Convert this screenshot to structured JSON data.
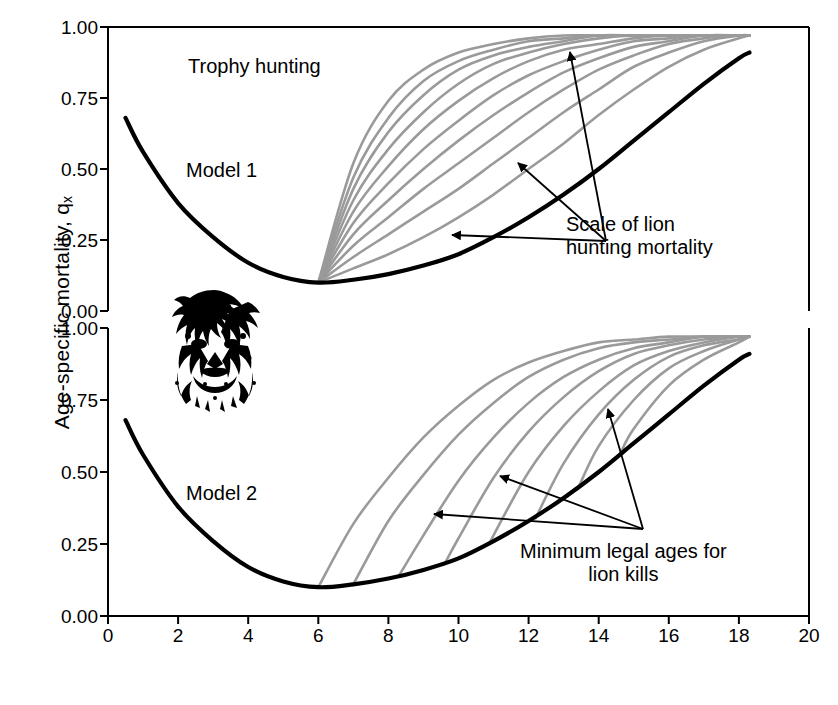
{
  "figure": {
    "x_axis_label": "Age (years)",
    "y_axis_label_main": "Age-specific mortality, q",
    "y_axis_label_sub": "x"
  },
  "annotations": {
    "trophy_hunting": "Trophy hunting",
    "model1": "Model 1",
    "model2": "Model 2",
    "scale_line1": "Scale of lion",
    "scale_line2": "hunting mortality",
    "minages_line1": "Minimum legal ages for",
    "minages_line2": "lion kills",
    "lion_image": "lion-head-illustration"
  },
  "chart_data": {
    "type": "line",
    "title": "Trophy hunting",
    "xlabel": "Age (years)",
    "ylabel": "Age-specific mortality, q_x",
    "xlim": [
      0,
      20
    ],
    "xticks": [
      0,
      2,
      4,
      6,
      8,
      10,
      12,
      14,
      16,
      18,
      20
    ],
    "grid": false,
    "legend": "none",
    "colors": {
      "baseline": "#000000",
      "scenario": "#9a9a9a",
      "axis": "#000000",
      "background": "#ffffff"
    },
    "panels": [
      {
        "name": "Model 1",
        "label": "Model 1",
        "ylim": [
          0,
          1
        ],
        "yticks": [
          0.0,
          0.25,
          0.5,
          0.75,
          1.0
        ],
        "ytick_labels": [
          "0.00",
          "0.25",
          "0.50",
          "0.75",
          "1.00"
        ],
        "annotation": "Scale of lion hunting mortality",
        "series": [
          {
            "name": "Natural mortality (baseline)",
            "style": "solid-black",
            "x": [
              0.5,
              1,
              2,
              3,
              4,
              5,
              6,
              7,
              8,
              9,
              10,
              11,
              12,
              13,
              14,
              15,
              16,
              17,
              18,
              18.3
            ],
            "values": [
              0.68,
              0.56,
              0.38,
              0.26,
              0.17,
              0.12,
              0.1,
              0.11,
              0.13,
              0.16,
              0.2,
              0.26,
              0.33,
              0.41,
              0.5,
              0.6,
              0.7,
              0.8,
              0.89,
              0.91
            ]
          },
          {
            "name": "Hunting scale 1 (lowest)",
            "style": "solid-grey",
            "x": [
              6,
              7,
              8,
              9,
              10,
              11,
              12,
              13,
              14,
              15,
              16,
              17,
              18,
              18.3
            ],
            "values": [
              0.1,
              0.15,
              0.2,
              0.26,
              0.33,
              0.41,
              0.5,
              0.59,
              0.69,
              0.78,
              0.86,
              0.92,
              0.96,
              0.97
            ]
          },
          {
            "name": "Hunting scale 2",
            "style": "solid-grey",
            "x": [
              6,
              7,
              8,
              9,
              10,
              11,
              12,
              13,
              14,
              15,
              16,
              17,
              18,
              18.3
            ],
            "values": [
              0.1,
              0.19,
              0.27,
              0.35,
              0.43,
              0.52,
              0.61,
              0.7,
              0.78,
              0.86,
              0.91,
              0.95,
              0.97,
              0.97
            ]
          },
          {
            "name": "Hunting scale 3",
            "style": "solid-grey",
            "x": [
              6,
              7,
              8,
              9,
              10,
              11,
              12,
              13,
              14,
              15,
              16,
              17,
              18,
              18.3
            ],
            "values": [
              0.1,
              0.23,
              0.33,
              0.43,
              0.52,
              0.61,
              0.7,
              0.78,
              0.85,
              0.9,
              0.94,
              0.96,
              0.97,
              0.97
            ]
          },
          {
            "name": "Hunting scale 4",
            "style": "solid-grey",
            "x": [
              6,
              7,
              8,
              9,
              10,
              11,
              12,
              13,
              14,
              15,
              16,
              17,
              18,
              18.3
            ],
            "values": [
              0.1,
              0.27,
              0.39,
              0.5,
              0.6,
              0.69,
              0.77,
              0.84,
              0.89,
              0.93,
              0.95,
              0.97,
              0.97,
              0.97
            ]
          },
          {
            "name": "Hunting scale 5",
            "style": "solid-grey",
            "x": [
              6,
              7,
              8,
              9,
              10,
              11,
              12,
              13,
              14,
              15,
              16,
              17,
              18,
              18.3
            ],
            "values": [
              0.1,
              0.31,
              0.45,
              0.57,
              0.67,
              0.76,
              0.83,
              0.88,
              0.92,
              0.95,
              0.96,
              0.97,
              0.97,
              0.97
            ]
          },
          {
            "name": "Hunting scale 6",
            "style": "solid-grey",
            "x": [
              6,
              7,
              8,
              9,
              10,
              11,
              12,
              13,
              14,
              15,
              16,
              17,
              18,
              18.3
            ],
            "values": [
              0.1,
              0.35,
              0.51,
              0.64,
              0.74,
              0.82,
              0.88,
              0.92,
              0.94,
              0.96,
              0.97,
              0.97,
              0.97,
              0.97
            ]
          },
          {
            "name": "Hunting scale 7",
            "style": "solid-grey",
            "x": [
              6,
              7,
              8,
              9,
              10,
              11,
              12,
              13,
              14,
              15,
              16,
              17,
              18,
              18.3
            ],
            "values": [
              0.1,
              0.39,
              0.57,
              0.7,
              0.8,
              0.87,
              0.91,
              0.94,
              0.96,
              0.97,
              0.97,
              0.97,
              0.97,
              0.97
            ]
          },
          {
            "name": "Hunting scale 8",
            "style": "solid-grey",
            "x": [
              6,
              7,
              8,
              9,
              10,
              11,
              12,
              13,
              14,
              15,
              16,
              17,
              18,
              18.3
            ],
            "values": [
              0.1,
              0.43,
              0.63,
              0.76,
              0.85,
              0.9,
              0.93,
              0.95,
              0.97,
              0.97,
              0.97,
              0.97,
              0.97,
              0.97
            ]
          },
          {
            "name": "Hunting scale 9",
            "style": "solid-grey",
            "x": [
              6,
              7,
              8,
              9,
              10,
              11,
              12,
              13,
              14,
              15,
              16,
              17,
              18,
              18.3
            ],
            "values": [
              0.1,
              0.47,
              0.68,
              0.81,
              0.88,
              0.92,
              0.95,
              0.96,
              0.97,
              0.97,
              0.97,
              0.97,
              0.97,
              0.97
            ]
          },
          {
            "name": "Hunting scale 10 (highest)",
            "style": "solid-grey",
            "x": [
              6,
              7,
              8,
              9,
              10,
              11,
              12,
              13,
              14,
              15,
              16,
              17,
              18,
              18.3
            ],
            "values": [
              0.1,
              0.52,
              0.74,
              0.85,
              0.91,
              0.94,
              0.96,
              0.97,
              0.97,
              0.97,
              0.97,
              0.97,
              0.97,
              0.97
            ]
          }
        ]
      },
      {
        "name": "Model 2",
        "label": "Model 2",
        "ylim": [
          0,
          1
        ],
        "yticks": [
          0.0,
          0.25,
          0.5,
          0.75,
          1.0
        ],
        "ytick_labels": [
          "0.00",
          "0.25",
          "0.50",
          "0.75",
          "1.00"
        ],
        "annotation": "Minimum legal ages for lion kills",
        "series": [
          {
            "name": "Natural mortality (baseline)",
            "style": "solid-black",
            "x": [
              0.5,
              1,
              2,
              3,
              4,
              5,
              6,
              7,
              8,
              9,
              10,
              11,
              12,
              13,
              14,
              15,
              16,
              17,
              18,
              18.3
            ],
            "values": [
              0.68,
              0.56,
              0.38,
              0.26,
              0.17,
              0.12,
              0.1,
              0.11,
              0.13,
              0.16,
              0.2,
              0.26,
              0.33,
              0.41,
              0.5,
              0.6,
              0.7,
              0.8,
              0.89,
              0.91
            ]
          },
          {
            "name": "Minimum legal age 6",
            "style": "solid-grey",
            "start_age": 6,
            "x": [
              6,
              7,
              8,
              9,
              10,
              11,
              12,
              13,
              14,
              15,
              16,
              17,
              18,
              18.3
            ],
            "values": [
              0.1,
              0.32,
              0.48,
              0.62,
              0.73,
              0.82,
              0.88,
              0.92,
              0.95,
              0.96,
              0.97,
              0.97,
              0.97,
              0.97
            ]
          },
          {
            "name": "Minimum legal age 7",
            "style": "solid-grey",
            "start_age": 7,
            "x": [
              7,
              8,
              9,
              10,
              11,
              12,
              13,
              14,
              15,
              16,
              17,
              18,
              18.3
            ],
            "values": [
              0.11,
              0.33,
              0.49,
              0.63,
              0.74,
              0.83,
              0.89,
              0.93,
              0.95,
              0.96,
              0.97,
              0.97,
              0.97
            ]
          },
          {
            "name": "Minimum legal age 8.3",
            "style": "solid-grey",
            "start_age": 8.3,
            "x": [
              8.3,
              9,
              10,
              11,
              12,
              13,
              14,
              15,
              16,
              17,
              18,
              18.3
            ],
            "values": [
              0.14,
              0.28,
              0.47,
              0.62,
              0.74,
              0.83,
              0.89,
              0.93,
              0.95,
              0.97,
              0.97,
              0.97
            ]
          },
          {
            "name": "Minimum legal age 9.6",
            "style": "solid-grey",
            "start_age": 9.6,
            "x": [
              9.6,
              10,
              11,
              12,
              13,
              14,
              15,
              16,
              17,
              18,
              18.3
            ],
            "values": [
              0.18,
              0.27,
              0.48,
              0.64,
              0.76,
              0.85,
              0.91,
              0.94,
              0.96,
              0.97,
              0.97
            ]
          },
          {
            "name": "Minimum legal age 10.9",
            "style": "solid-grey",
            "start_age": 10.9,
            "x": [
              10.9,
              11,
              12,
              13,
              14,
              15,
              16,
              17,
              18,
              18.3
            ],
            "values": [
              0.25,
              0.28,
              0.5,
              0.66,
              0.78,
              0.87,
              0.92,
              0.95,
              0.97,
              0.97
            ]
          },
          {
            "name": "Minimum legal age 12.2",
            "style": "solid-grey",
            "start_age": 12.2,
            "x": [
              12.2,
              13,
              14,
              15,
              16,
              17,
              18,
              18.3
            ],
            "values": [
              0.34,
              0.53,
              0.7,
              0.82,
              0.9,
              0.94,
              0.96,
              0.97
            ]
          },
          {
            "name": "Minimum legal age 13.4",
            "style": "solid-grey",
            "start_age": 13.4,
            "x": [
              13.4,
              14,
              15,
              16,
              17,
              18,
              18.3
            ],
            "values": [
              0.44,
              0.59,
              0.75,
              0.86,
              0.92,
              0.96,
              0.97
            ]
          },
          {
            "name": "Minimum legal age 14.6",
            "style": "solid-grey",
            "start_age": 14.6,
            "x": [
              14.6,
              15,
              16,
              17,
              18,
              18.3
            ],
            "values": [
              0.56,
              0.65,
              0.8,
              0.89,
              0.95,
              0.97
            ]
          }
        ]
      }
    ]
  }
}
